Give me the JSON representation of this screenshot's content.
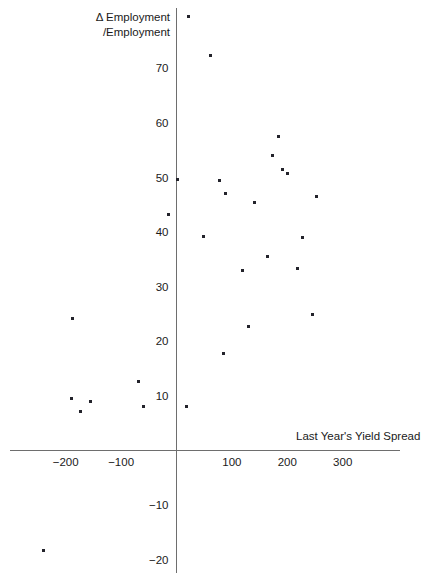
{
  "chart_data": {
    "type": "scatter",
    "title": "",
    "xlabel": "Last Year's Yield Spread",
    "ylabel": "Δ Employment /Employment",
    "ylabel_line1": "Δ Employment",
    "ylabel_line2": "/Employment",
    "xlim": [
      -300,
      410
    ],
    "ylim": [
      -21,
      82
    ],
    "grid": false,
    "legend": null,
    "xticks": [
      -200,
      -100,
      100,
      200,
      300
    ],
    "xtick_labels": [
      "−200",
      "−100",
      "100",
      "200",
      "300"
    ],
    "yticks": [
      70,
      60,
      50,
      40,
      30,
      20,
      10,
      -10,
      -20
    ],
    "ytick_labels": [
      "70",
      "60",
      "50",
      "40",
      "30",
      "20",
      "10",
      "−10",
      "−20"
    ],
    "marker_color": "#23232b",
    "axis_color": "#6e6e6e",
    "points": [
      {
        "x": 22,
        "y": 79.5
      },
      {
        "x": 62,
        "y": 72.3
      },
      {
        "x": 185,
        "y": 57.5
      },
      {
        "x": 174,
        "y": 54.0
      },
      {
        "x": 192,
        "y": 51.5
      },
      {
        "x": 201,
        "y": 50.8
      },
      {
        "x": 2,
        "y": 49.7
      },
      {
        "x": 78,
        "y": 49.5
      },
      {
        "x": 88,
        "y": 47.0
      },
      {
        "x": 140,
        "y": 45.5
      },
      {
        "x": 253,
        "y": 46.5
      },
      {
        "x": -14,
        "y": 43.2
      },
      {
        "x": 48,
        "y": 39.2
      },
      {
        "x": 227,
        "y": 39.0
      },
      {
        "x": 165,
        "y": 35.5
      },
      {
        "x": 120,
        "y": 33.0
      },
      {
        "x": 218,
        "y": 33.3
      },
      {
        "x": 246,
        "y": 25.0
      },
      {
        "x": -187,
        "y": 24.2
      },
      {
        "x": 130,
        "y": 22.7
      },
      {
        "x": 85,
        "y": 17.8
      },
      {
        "x": -69,
        "y": 12.7
      },
      {
        "x": -190,
        "y": 9.5
      },
      {
        "x": -155,
        "y": 9.0
      },
      {
        "x": 18,
        "y": 8.0
      },
      {
        "x": -174,
        "y": 7.2
      },
      {
        "x": -60,
        "y": 8.0
      },
      {
        "x": -240,
        "y": -18.3
      }
    ]
  }
}
